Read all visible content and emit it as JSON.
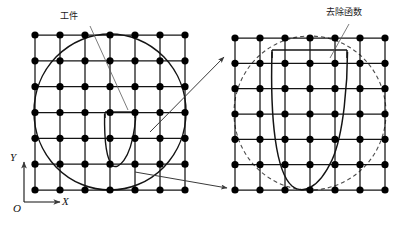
{
  "figure": {
    "type": "diagram",
    "background_color": "#ffffff",
    "line_color": "#141414",
    "node_color": "#000000",
    "dashed_color": "#4d4d4d",
    "leader_color": "#5a5a5a"
  },
  "labels": {
    "workpiece": "工件",
    "removal_function": "去除函数"
  },
  "axes": {
    "y_label": "Y",
    "x_label": "X",
    "origin_label": "O",
    "origin_px": [
      24,
      202
    ],
    "y_tip_px": [
      24,
      160
    ],
    "x_tip_px": [
      62,
      202
    ]
  },
  "panels": [
    {
      "name": "left-panel",
      "grid": {
        "rows": 7,
        "cols": 7,
        "x0": 35,
        "y0": 35,
        "x1": 185,
        "y1": 190,
        "node_radius": 3.6
      },
      "workpiece_circle": {
        "style": "solid",
        "cx": 110,
        "cy": 112,
        "rx": 76,
        "ry": 78
      },
      "removal_function": {
        "style": "solid",
        "shape": "parabola-with-cap",
        "left_x": 105,
        "right_x": 135,
        "top_y": 114,
        "bottom_y": 166,
        "cap_top_y": 112
      }
    },
    {
      "name": "right-panel",
      "grid": {
        "rows": 7,
        "cols": 7,
        "x0": 235,
        "y0": 38,
        "x1": 385,
        "y1": 190,
        "node_radius": 3.6
      },
      "workpiece_circle": {
        "style": "dashed",
        "cx": 310,
        "cy": 113,
        "rx": 76,
        "ry": 77
      },
      "removal_function": {
        "style": "solid",
        "shape": "parabola-with-cap",
        "left_x": 272,
        "right_x": 347,
        "top_y": 52,
        "bottom_y": 190,
        "cap_top_y": 50
      }
    }
  ],
  "leaders": [
    {
      "name": "workpiece-leader",
      "from": [
        90,
        24
      ],
      "to": [
        128,
        110
      ]
    },
    {
      "name": "removal-function-leader",
      "from": [
        349,
        22
      ],
      "to": [
        330,
        56
      ]
    }
  ],
  "arrows": [
    {
      "name": "arrow-upper",
      "from": [
        150,
        132
      ],
      "to": [
        225,
        56
      ]
    },
    {
      "name": "arrow-lower",
      "from": [
        135,
        172
      ],
      "to": [
        228,
        188
      ]
    }
  ]
}
